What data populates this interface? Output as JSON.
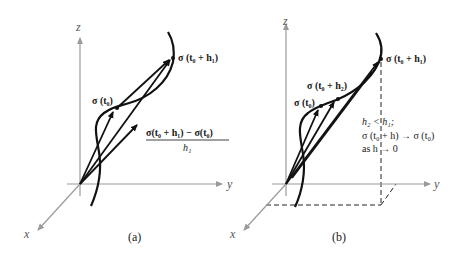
{
  "figure": {
    "panels": [
      {
        "caption": "(a)",
        "axes": {
          "x": "x",
          "y": "y",
          "z": "z"
        },
        "points": {
          "p0": "σ (t₀)",
          "p1": "σ (t₀ + h₁)"
        },
        "difference_quotient": {
          "numerator": "σ(t₀ + h₁) − σ(t₀)",
          "denominator": "h₁"
        }
      },
      {
        "caption": "(b)",
        "axes": {
          "x": "x",
          "y": "y",
          "z": "z"
        },
        "points": {
          "p0": "σ (t₀)",
          "p2": "σ (t₀ + h₂)",
          "p1": "σ (t₀ + h₁)"
        },
        "note": {
          "line1": "h₂ < h₁;",
          "line2": "σ (t₀ + h) → σ (t₀)",
          "line3": "as h → 0"
        }
      }
    ],
    "colors": {
      "curve": "#111111",
      "axes": "#9a9a9a",
      "background": "#ffffff"
    }
  }
}
